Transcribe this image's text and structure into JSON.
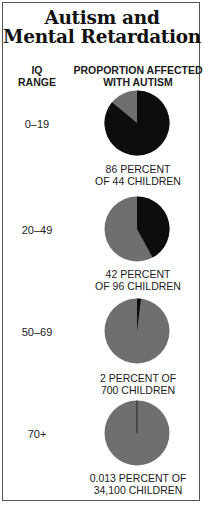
{
  "title": {
    "line1": "Autism and",
    "line2": "Mental Retardation"
  },
  "headers": {
    "iq_line1": "IQ",
    "iq_line2": "RANGE",
    "prop_line1": "PROPORTION AFFECTED",
    "prop_line2": "WITH AUTISM"
  },
  "colors": {
    "autism": "#0d0d0d",
    "not_autism": "#6f6f6f",
    "border": "#555555"
  },
  "rows": [
    {
      "iq": "0–19",
      "cap1": "86 PERCENT",
      "cap2": "OF 44 CHILDREN"
    },
    {
      "iq": "20–49",
      "cap1": "42 PERCENT",
      "cap2": "OF 96 CHILDREN"
    },
    {
      "iq": "50–69",
      "cap1": "2 PERCENT OF",
      "cap2": "700 CHILDREN"
    },
    {
      "iq": "70+",
      "cap1": "0.013 PERCENT OF",
      "cap2": "34,100 CHILDREN"
    }
  ],
  "chart_data": {
    "type": "pie",
    "xlabel": "IQ RANGE",
    "ylabel": "PROPORTION AFFECTED WITH AUTISM",
    "categories": [
      "0–19",
      "20–49",
      "50–69",
      "70+"
    ],
    "series": [
      {
        "name": "Percent affected with autism",
        "values": [
          86,
          42,
          2,
          0.013
        ]
      },
      {
        "name": "Number of children",
        "values": [
          44,
          96,
          700,
          34100
        ]
      }
    ],
    "slices_legend": [
      "Affected with autism (black)",
      "Not affected (gray)"
    ],
    "annotations": [
      "86 PERCENT OF 44 CHILDREN",
      "42 PERCENT OF 96 CHILDREN",
      "2 PERCENT OF 700 CHILDREN",
      "0.013 PERCENT OF 34,100 CHILDREN"
    ]
  }
}
